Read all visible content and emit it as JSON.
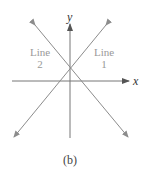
{
  "figure": {
    "caption": "(b)",
    "axes": {
      "x_label": "x",
      "y_label": "y"
    },
    "lines": [
      {
        "name_line1": "Line",
        "name_line2": "1",
        "slope_sign": "positive"
      },
      {
        "name_line1": "Line",
        "name_line2": "2",
        "slope_sign": "negative"
      }
    ],
    "colors": {
      "lines": "#8c8c8c",
      "axes": "#777777",
      "text": "#999999",
      "caption": "#444444"
    }
  }
}
